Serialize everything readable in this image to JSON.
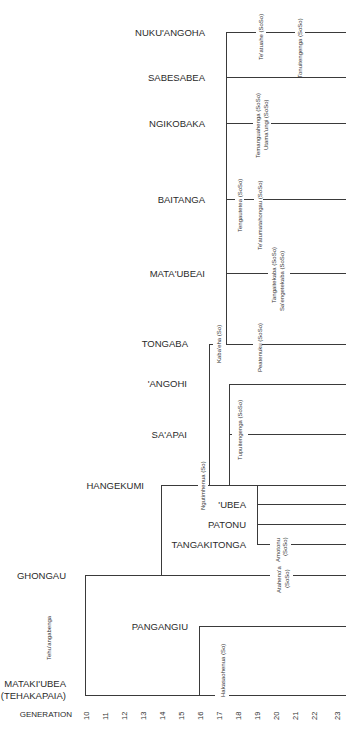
{
  "axis": {
    "title": "GENERATION",
    "ticks": [
      "10",
      "11",
      "12",
      "13",
      "14",
      "15",
      "16",
      "17",
      "18",
      "19",
      "20",
      "21",
      "22",
      "23"
    ]
  },
  "lineages": [
    {
      "name": "NUKU'ANGOHA"
    },
    {
      "name": "SABESABEA"
    },
    {
      "name": "NGIKOBAKA"
    },
    {
      "name": "BAITANGA"
    },
    {
      "name": "MATA'UBEAI"
    },
    {
      "name": "TONGABA"
    },
    {
      "name": "'ANGOHI"
    },
    {
      "name": "SA'APAI"
    },
    {
      "name": "HANGEKUMI"
    },
    {
      "name": "'UBEA"
    },
    {
      "name": "PATONU"
    },
    {
      "name": "TANGAKITONGA"
    },
    {
      "name": "GHONGAU"
    },
    {
      "name": "PANGANGIU"
    },
    {
      "name": "MATAKI'UBEA"
    },
    {
      "name": "(TEHAKAPAIA)"
    }
  ],
  "persons": [
    {
      "name": "Te'atuahe (SoSo)"
    },
    {
      "name": "Tonuitengenga (SoSo)"
    },
    {
      "name": "Temanguahenga (SoSo)"
    },
    {
      "name": "Utama'ungi (SoSo)"
    },
    {
      "name": "Tengautetea (SoSo)"
    },
    {
      "name": "Te'atumatahongau (SoSo)"
    },
    {
      "name": "Tangaitekaba (SoSo)"
    },
    {
      "name": "Sa'engetekaba (SoSo)"
    },
    {
      "name": "Kaba'eha (So)"
    },
    {
      "name": "Peatenuku (SoSo)"
    },
    {
      "name": "Tupuitengenga (SoSo)"
    },
    {
      "name": "Ngutimhenua (So)"
    },
    {
      "name": "Amotonu"
    },
    {
      "name": "(SoSo)"
    },
    {
      "name": "Ataheno'a"
    },
    {
      "name": "(SoSo)"
    },
    {
      "name": "Tehu'angabenga"
    },
    {
      "name": "Hakasaohenua (So)"
    }
  ]
}
